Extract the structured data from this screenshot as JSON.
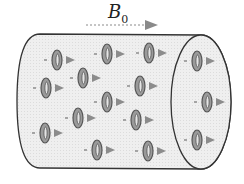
{
  "field": {
    "symbol": "B",
    "subscript": "0",
    "arrow_color": "#8a8a8a"
  },
  "colors": {
    "cylinder_fill": "#ececec",
    "cylinder_stroke": "#333333",
    "ring_dark": "#555555",
    "ring_light": "#9a9a9a",
    "arrow": "#8c8c8c"
  },
  "spins": [
    {
      "x": 57,
      "y": 60
    },
    {
      "x": 107,
      "y": 54
    },
    {
      "x": 149,
      "y": 53
    },
    {
      "x": 197,
      "y": 61
    },
    {
      "x": 83,
      "y": 78
    },
    {
      "x": 46,
      "y": 88
    },
    {
      "x": 140,
      "y": 86
    },
    {
      "x": 107,
      "y": 102
    },
    {
      "x": 207,
      "y": 102
    },
    {
      "x": 78,
      "y": 118
    },
    {
      "x": 136,
      "y": 120
    },
    {
      "x": 45,
      "y": 133
    },
    {
      "x": 197,
      "y": 140
    },
    {
      "x": 97,
      "y": 150
    },
    {
      "x": 148,
      "y": 151
    }
  ]
}
